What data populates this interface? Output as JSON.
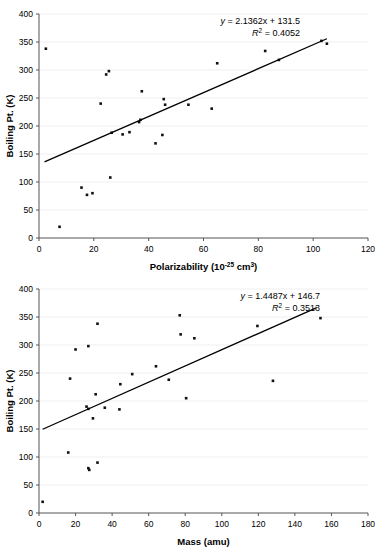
{
  "page": {
    "top_fragment": ""
  },
  "charts": [
    {
      "id": "polarizability-chart",
      "name": "boiling-point-vs-polarizability",
      "equation": "y = 2.1362x + 131.5",
      "equation_prefix": "y",
      "equation_body": " = 2.1362x + 131.5",
      "r2_symbol": "R",
      "r2_exp": "2",
      "r2_value": " = 0.4052",
      "xlabel_main": "Polarizability (10",
      "xlabel_exp": "-25",
      "xlabel_tail": " cm",
      "xlabel_tail_exp": "3",
      "xlabel_close": ")",
      "ylabel": "Boiling Pt. (K)",
      "xticks": [
        "0",
        "20",
        "40",
        "60",
        "80",
        "100",
        "120"
      ],
      "yticks": [
        "0",
        "50",
        "100",
        "150",
        "200",
        "250",
        "300",
        "350",
        "400"
      ]
    },
    {
      "id": "mass-chart",
      "name": "boiling-point-vs-mass",
      "equation": "y = 1.4487x + 146.7",
      "equation_prefix": "y",
      "equation_body": " = 1.4487x + 146.7",
      "r2_symbol": "R",
      "r2_exp": "2",
      "r2_value": " = 0.3513",
      "xlabel_main": "Mass (amu)",
      "ylabel": "Boiling Pt. (K)",
      "xticks": [
        "0",
        "20",
        "40",
        "60",
        "80",
        "100",
        "120",
        "140",
        "160",
        "180"
      ],
      "yticks": [
        "0",
        "50",
        "100",
        "150",
        "200",
        "250",
        "300",
        "350",
        "400"
      ]
    }
  ],
  "chart_data": [
    {
      "type": "scatter",
      "title": "",
      "xlabel": "Polarizability (10^-25 cm^3)",
      "ylabel": "Boiling Pt. (K)",
      "xlim": [
        0,
        120
      ],
      "ylim": [
        0,
        400
      ],
      "xticks": [
        0,
        20,
        40,
        60,
        80,
        100,
        120
      ],
      "yticks": [
        0,
        50,
        100,
        150,
        200,
        250,
        300,
        350,
        400
      ],
      "grid": "horizontal",
      "legend": "none",
      "marker": "small-black-square",
      "annotations": [
        "y = 2.1362x + 131.5",
        "R2 = 0.4052"
      ],
      "trendline": {
        "type": "linear",
        "slope": 2.1362,
        "intercept": 131.5,
        "r2": 0.4052,
        "x_start": 2,
        "x_end": 105
      },
      "points": [
        {
          "x": 2.5,
          "y": 338
        },
        {
          "x": 7.5,
          "y": 20
        },
        {
          "x": 15.5,
          "y": 90
        },
        {
          "x": 17.5,
          "y": 77
        },
        {
          "x": 19.5,
          "y": 80
        },
        {
          "x": 22.5,
          "y": 240
        },
        {
          "x": 24.5,
          "y": 292
        },
        {
          "x": 25.5,
          "y": 298
        },
        {
          "x": 26.0,
          "y": 108
        },
        {
          "x": 26.5,
          "y": 188
        },
        {
          "x": 30.5,
          "y": 185
        },
        {
          "x": 33.0,
          "y": 189
        },
        {
          "x": 36.5,
          "y": 207
        },
        {
          "x": 37.0,
          "y": 211
        },
        {
          "x": 37.5,
          "y": 262
        },
        {
          "x": 42.5,
          "y": 169
        },
        {
          "x": 45.0,
          "y": 184
        },
        {
          "x": 45.5,
          "y": 248
        },
        {
          "x": 46.0,
          "y": 238
        },
        {
          "x": 54.5,
          "y": 238
        },
        {
          "x": 63.0,
          "y": 231
        },
        {
          "x": 65.0,
          "y": 312
        },
        {
          "x": 82.5,
          "y": 334
        },
        {
          "x": 87.5,
          "y": 318
        },
        {
          "x": 103.0,
          "y": 352
        },
        {
          "x": 105.0,
          "y": 347
        }
      ]
    },
    {
      "type": "scatter",
      "title": "",
      "xlabel": "Mass (amu)",
      "ylabel": "Boiling Pt. (K)",
      "xlim": [
        0,
        180
      ],
      "ylim": [
        0,
        400
      ],
      "xticks": [
        0,
        20,
        40,
        60,
        80,
        100,
        120,
        140,
        160,
        180
      ],
      "yticks": [
        0,
        50,
        100,
        150,
        200,
        250,
        300,
        350,
        400
      ],
      "grid": "horizontal",
      "legend": "none",
      "marker": "small-black-square",
      "annotations": [
        "y = 1.4487x + 146.7",
        "R2 = 0.3513"
      ],
      "trendline": {
        "type": "linear",
        "slope": 1.4487,
        "intercept": 146.7,
        "r2": 0.3513,
        "x_start": 2,
        "x_end": 152
      },
      "points": [
        {
          "x": 2.0,
          "y": 20
        },
        {
          "x": 16.0,
          "y": 108
        },
        {
          "x": 17.0,
          "y": 240
        },
        {
          "x": 20.0,
          "y": 292
        },
        {
          "x": 26.0,
          "y": 190
        },
        {
          "x": 27.0,
          "y": 186
        },
        {
          "x": 27.0,
          "y": 80
        },
        {
          "x": 27.5,
          "y": 77
        },
        {
          "x": 27.0,
          "y": 298
        },
        {
          "x": 29.5,
          "y": 169
        },
        {
          "x": 31.0,
          "y": 212
        },
        {
          "x": 32.0,
          "y": 90
        },
        {
          "x": 32.0,
          "y": 338
        },
        {
          "x": 36.0,
          "y": 188
        },
        {
          "x": 44.0,
          "y": 185
        },
        {
          "x": 44.5,
          "y": 230
        },
        {
          "x": 51.0,
          "y": 248
        },
        {
          "x": 64.0,
          "y": 262
        },
        {
          "x": 71.0,
          "y": 238
        },
        {
          "x": 77.0,
          "y": 353
        },
        {
          "x": 77.5,
          "y": 319
        },
        {
          "x": 80.5,
          "y": 205
        },
        {
          "x": 85.0,
          "y": 312
        },
        {
          "x": 119.5,
          "y": 334
        },
        {
          "x": 128.0,
          "y": 236
        },
        {
          "x": 154.0,
          "y": 348
        }
      ]
    }
  ]
}
